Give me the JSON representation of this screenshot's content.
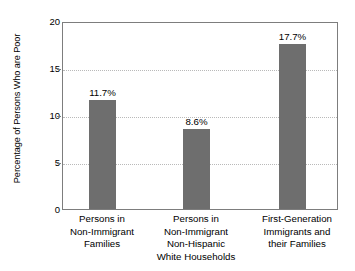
{
  "chart_data": {
    "type": "bar",
    "title": "",
    "xlabel": "",
    "ylabel": "Percentage of Persons Who are Poor",
    "ylim": [
      0,
      20
    ],
    "yticks": [
      0,
      5,
      10,
      15,
      20
    ],
    "ytick_labels": [
      "0",
      "5",
      "10",
      "15",
      "20"
    ],
    "grid": true,
    "grid_axis": "y",
    "legend": "none",
    "bar_color": "#6e6e6e",
    "categories": [
      "Persons in Non-Immigrant Families",
      "Persons in Non-Immigrant Non-Hispanic White Households",
      "First-Generation Immigrants and their Families"
    ],
    "category_lines": [
      [
        "Persons in",
        "Non-Immigrant",
        "Families"
      ],
      [
        "Persons in",
        "Non-Immigrant",
        "Non-Hispanic",
        "White Households"
      ],
      [
        "First-Generation",
        "Immigrants and",
        "their Families"
      ]
    ],
    "values": [
      11.7,
      8.6,
      17.7
    ],
    "value_labels": [
      "11.7%",
      "8.6%",
      "17.7%"
    ]
  }
}
